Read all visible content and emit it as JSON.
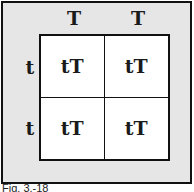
{
  "diagram": {
    "type": "punnett-square",
    "column_alleles": [
      "T",
      "T"
    ],
    "row_alleles": [
      "t",
      "t"
    ],
    "cells": [
      [
        "tT",
        "tT"
      ],
      [
        "tT",
        "tT"
      ]
    ],
    "caption": "Fig. 3.-18"
  },
  "colors": {
    "frame_background": "#e6e6e6",
    "grid_background": "#ffffff",
    "border": "#111111",
    "text": "#1a1a1a"
  }
}
